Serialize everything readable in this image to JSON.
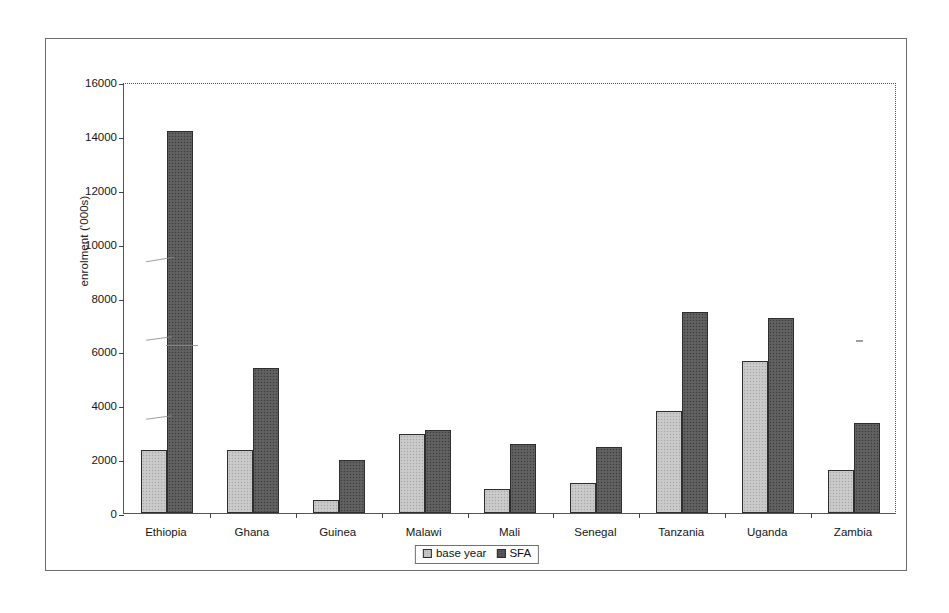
{
  "chart_data": {
    "type": "bar",
    "title": "",
    "subtitle": "",
    "xlabel": "",
    "ylabel": "enrolment ('000s)",
    "categories": [
      "Ethiopia",
      "Ghana",
      "Guinea",
      "Malawi",
      "Mali",
      "Senegal",
      "Tanzania",
      "Uganda",
      "Zambia"
    ],
    "series": [
      {
        "name": "base year",
        "color": "#c6c6c6",
        "values": [
          2350,
          2350,
          500,
          2930,
          900,
          1100,
          3800,
          5650,
          1600
        ]
      },
      {
        "name": "SFA",
        "color": "#5c5c5c",
        "values": [
          14200,
          5400,
          1950,
          3080,
          2550,
          2450,
          7450,
          7250,
          3350
        ]
      }
    ],
    "ylim": [
      0,
      16000
    ],
    "y_ticks": [
      0,
      2000,
      4000,
      6000,
      8000,
      10000,
      12000,
      14000,
      16000
    ],
    "y_tick_labels": [
      "0",
      "2000",
      "4000",
      "6000",
      "8000",
      "10000",
      "12000",
      "14000",
      "16000"
    ],
    "grid": false,
    "legend_position": "bottom-center",
    "legend_entries": [
      "base year",
      "SFA"
    ]
  },
  "legend": {
    "base_label": "base year",
    "sfa_label": "SFA"
  },
  "axes": {
    "y_title": "enrolment ('000s)"
  }
}
